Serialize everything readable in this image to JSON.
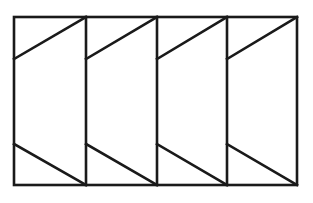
{
  "diagram": {
    "type": "geometric-figure",
    "stroke_color": "#1a1a1a",
    "background": "#ffffff",
    "stroke_width": 2.6,
    "outer_rect": {
      "x1": 14,
      "y1": 17,
      "x2": 297,
      "y2": 185
    },
    "dividers_x": [
      86,
      157,
      227
    ],
    "panels": [
      {
        "left": 14,
        "right": 86,
        "top_diag": {
          "y_left": 59,
          "y_right": 17
        },
        "bottom_diag": {
          "y_left": 144,
          "y_right": 185
        }
      },
      {
        "left": 86,
        "right": 157,
        "top_diag": {
          "y_left": 59,
          "y_right": 17
        },
        "bottom_diag": {
          "y_left": 144,
          "y_right": 185
        }
      },
      {
        "left": 157,
        "right": 227,
        "top_diag": {
          "y_left": 59,
          "y_right": 17
        },
        "bottom_diag": {
          "y_left": 144,
          "y_right": 185
        }
      },
      {
        "left": 227,
        "right": 297,
        "top_diag": {
          "y_left": 59,
          "y_right": 17
        },
        "bottom_diag": {
          "y_left": 144,
          "y_right": 185
        }
      }
    ]
  }
}
